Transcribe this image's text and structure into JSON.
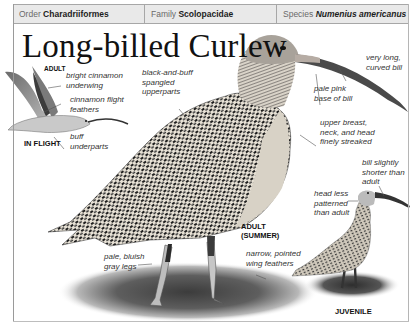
{
  "header": {
    "order": {
      "label": "Order",
      "value": "Charadriiformes"
    },
    "family": {
      "label": "Family",
      "value": "Scolopacidae"
    },
    "species": {
      "label": "Species",
      "value": "Numenius americanus"
    }
  },
  "title": "Long-billed Curlew",
  "illustrations": [
    {
      "name": "adult-in-flight",
      "tag_top": "ADULT",
      "tag_bottom": "IN FLIGHT"
    },
    {
      "name": "adult-summer",
      "tag_line1": "ADULT",
      "tag_line2": "(SUMMER)"
    },
    {
      "name": "juvenile",
      "tag": "JUVENILE"
    }
  ],
  "annotations": {
    "flight_underwing": [
      "bright cinnamon",
      "underwing"
    ],
    "flight_feathers": [
      "cinnamon flight",
      "feathers"
    ],
    "flight_underparts": [
      "buff",
      "underparts"
    ],
    "upperparts": [
      "black-and-buff",
      "spangled",
      "upperparts"
    ],
    "bill": [
      "very long,",
      "curved bill"
    ],
    "bill_base": [
      "pale pink",
      "base of bill"
    ],
    "breast": [
      "upper breast,",
      "neck, and head",
      "finely streaked"
    ],
    "juv_bill": [
      "bill slightly",
      "shorter than",
      "adult"
    ],
    "juv_head": [
      "head less",
      "patterned",
      "than adult"
    ],
    "juv_wing": [
      "narrow, pointed",
      "wing feathers"
    ],
    "legs": [
      "pale, bluish",
      "gray legs"
    ]
  },
  "colors": {
    "header_bg": "#e9e9e9",
    "border": "#a7a7a7",
    "text": "#111111",
    "annotation": "#333333"
  }
}
